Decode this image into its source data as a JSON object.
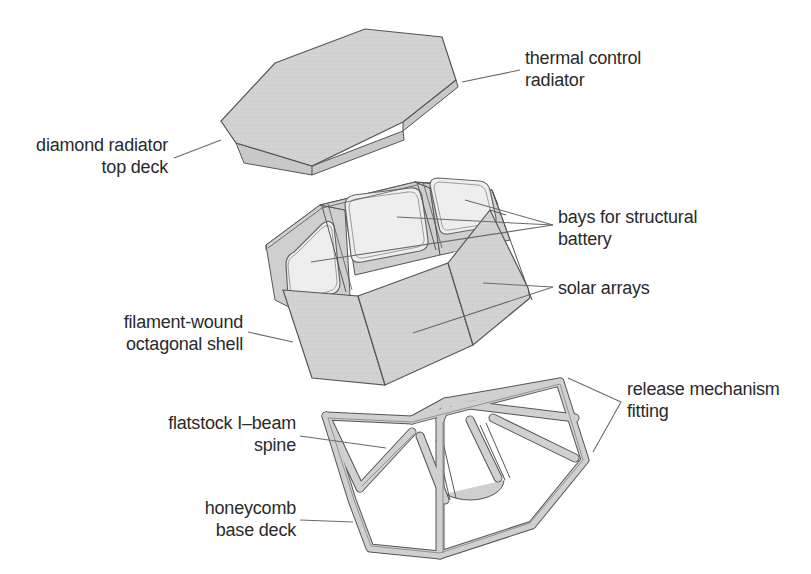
{
  "diagram": {
    "type": "exploded-view",
    "colors": {
      "panel_fill": "#d4d4d4",
      "window_fill": "#eeeeee",
      "outline": "#555555",
      "leader": "#6a6a6a",
      "text": "#2a2a2a"
    },
    "labels": {
      "thermal_control": {
        "line1": "thermal control",
        "line2": "radiator"
      },
      "diamond_radiator": {
        "line1": "diamond radiator",
        "line2": "top deck"
      },
      "bays": {
        "line1": "bays for structural",
        "line2": "battery"
      },
      "solar_arrays": {
        "line1": "solar arrays"
      },
      "filament_shell": {
        "line1": "filament-wound",
        "line2": "octagonal shell"
      },
      "release_mechanism": {
        "line1": "release mechanism",
        "line2": "fitting"
      },
      "ibeam_spine": {
        "line1": "flatstock I–beam",
        "line2": "spine"
      },
      "honeycomb_deck": {
        "line1": "honeycomb",
        "line2": "base deck"
      }
    },
    "components": [
      "top deck (octagonal plate)",
      "octagonal shell with battery bays and solar arrays",
      "base deck frame with I-beam spine"
    ]
  }
}
